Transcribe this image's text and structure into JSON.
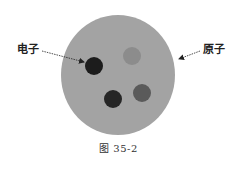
{
  "diagram": {
    "labels": {
      "electron": "电子",
      "atom": "原子"
    },
    "caption": "图 35-2",
    "colors": {
      "background": "#ffffff",
      "atom_fill": "#a3a3a3",
      "electron_dark_1": "#1c1c1c",
      "electron_dark_2": "#262626",
      "electron_medium": "#5a5a5a",
      "electron_light": "#8c8c8c",
      "arrow": "#222222"
    },
    "atom": {
      "cx": 118,
      "cy": 75,
      "rx": 57,
      "ry": 60
    },
    "electrons": [
      {
        "name": "electron-dark-upper-left",
        "cx": 94,
        "cy": 66,
        "r": 9,
        "color": "#1c1c1c"
      },
      {
        "name": "electron-light-upper-right",
        "cx": 132,
        "cy": 56,
        "r": 9,
        "color": "#8c8c8c"
      },
      {
        "name": "electron-dark-lower",
        "cx": 113,
        "cy": 99,
        "r": 9,
        "color": "#262626"
      },
      {
        "name": "electron-medium-lower-right",
        "cx": 142,
        "cy": 93,
        "r": 9,
        "color": "#5a5a5a"
      }
    ],
    "arrows": [
      {
        "name": "electron-pointer-arrow",
        "from": [
          42,
          51
        ],
        "to": [
          86,
          62
        ]
      },
      {
        "name": "atom-pointer-arrow",
        "from": [
          200,
          51
        ],
        "to": [
          177,
          60
        ]
      }
    ]
  }
}
